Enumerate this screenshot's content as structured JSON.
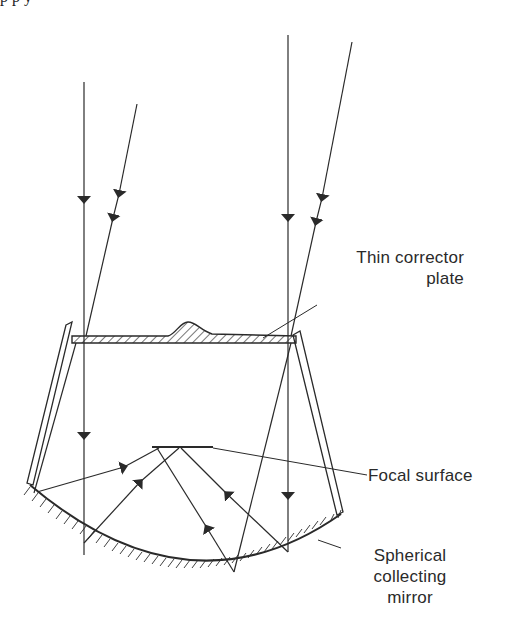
{
  "figure": {
    "top_cut_text": "p                                  p         y",
    "labels": {
      "corrector_plate": [
        "Thin corrector",
        "plate"
      ],
      "focal_surface": "Focal surface",
      "mirror": [
        "Spherical",
        "collecting",
        "mirror"
      ]
    },
    "colors": {
      "line": "#2a2a2a",
      "background": "#ffffff"
    }
  }
}
